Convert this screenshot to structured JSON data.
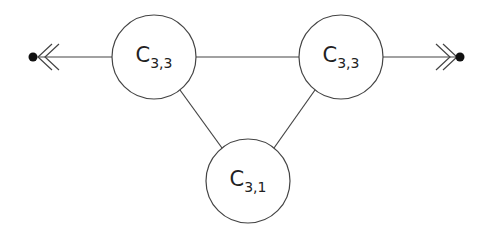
{
  "diagram": {
    "stroke_color": "#444444",
    "fill_color": "#ffffff",
    "dot_color": "#111111",
    "nodes": [
      {
        "id": "left",
        "label_main": "C",
        "label_sub": "3,3",
        "cx": 154,
        "cy": 57,
        "r": 42
      },
      {
        "id": "right",
        "label_main": "C",
        "label_sub": "3,3",
        "cx": 341,
        "cy": 57,
        "r": 42
      },
      {
        "id": "bottom",
        "label_main": "C",
        "label_sub": "3,1",
        "cx": 248,
        "cy": 181,
        "r": 42
      }
    ],
    "edges": [
      {
        "from": "left",
        "to": "right"
      },
      {
        "from": "left",
        "to": "bottom"
      },
      {
        "from": "right",
        "to": "bottom"
      }
    ],
    "terminals": [
      {
        "id": "left-terminal",
        "x": 33,
        "y": 57,
        "arrow": "double-open",
        "direction": "left"
      },
      {
        "id": "right-terminal",
        "x": 460,
        "y": 57,
        "arrow": "double-open",
        "direction": "right"
      }
    ]
  }
}
